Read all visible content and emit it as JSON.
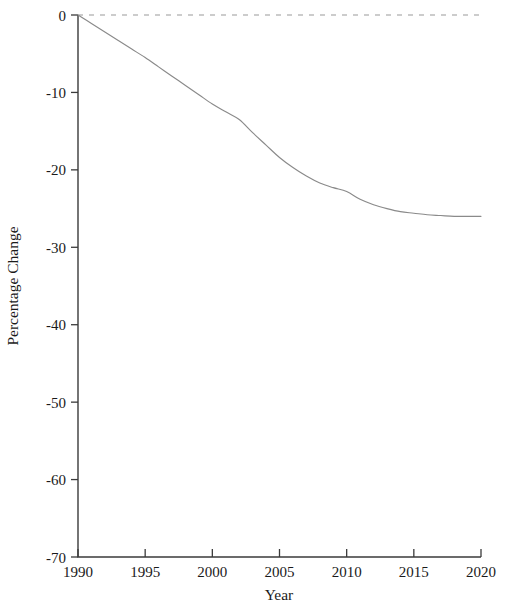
{
  "chart_data": {
    "type": "line",
    "title": "",
    "xlabel": "Year",
    "ylabel": "Percentage Change",
    "xlim": [
      1990,
      2020
    ],
    "ylim": [
      -70,
      0
    ],
    "grid": false,
    "legend": null,
    "x_ticks": [
      "1990",
      "1995",
      "2000",
      "2005",
      "2010",
      "2015",
      "2020"
    ],
    "x_tick_values": [
      1990,
      1995,
      2000,
      2005,
      2010,
      2015,
      2020
    ],
    "y_ticks": [
      "0",
      "-10",
      "-20",
      "-30",
      "-40",
      "-50",
      "-60",
      "-70"
    ],
    "y_tick_values": [
      0,
      -10,
      -20,
      -30,
      -40,
      -50,
      -60,
      -70
    ],
    "annotations": [
      {
        "name": "zero-reference-line",
        "type": "horizontal-dashed-line",
        "value": 0,
        "color": "#9a9a9a",
        "style": "dashed"
      }
    ],
    "series": [
      {
        "name": "Percentage Change",
        "color": "#8a8a8a",
        "style": "solid",
        "x": [
          1990,
          1991,
          1992,
          1993,
          1994,
          1995,
          1996,
          1997,
          1998,
          1999,
          2000,
          2001,
          2002,
          2003,
          2004,
          2005,
          2006,
          2007,
          2008,
          2009,
          2010,
          2011,
          2012,
          2013,
          2014,
          2015,
          2016,
          2017,
          2018,
          2019,
          2020
        ],
        "values": [
          0,
          -1.1,
          -2.2,
          -3.3,
          -4.4,
          -5.5,
          -6.7,
          -7.9,
          -9.1,
          -10.3,
          -11.5,
          -12.5,
          -13.5,
          -15.2,
          -16.8,
          -18.4,
          -19.7,
          -20.8,
          -21.7,
          -22.3,
          -22.8,
          -23.8,
          -24.5,
          -25.0,
          -25.4,
          -25.6,
          -25.8,
          -25.9,
          -26.0,
          -26.0,
          -26.0
        ]
      }
    ]
  },
  "colors": {
    "axis": "#3b3b3b",
    "series": "#8a8a8a",
    "zero_line": "#9a9a9a",
    "text": "#1a1a1a",
    "background": "#ffffff"
  }
}
